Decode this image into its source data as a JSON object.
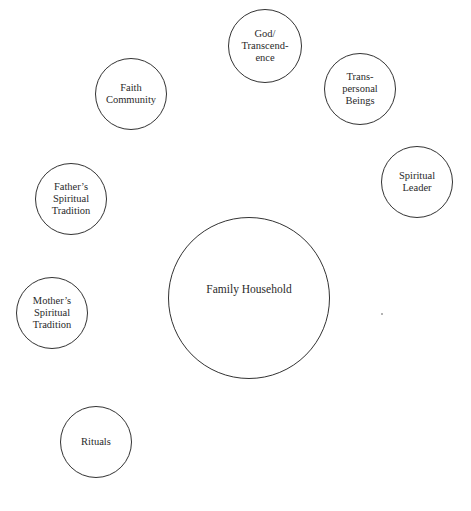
{
  "diagram": {
    "type": "spiritual-ecomap",
    "center": {
      "id": "family-household",
      "label": "Family Household",
      "cx": 249,
      "cy": 298,
      "r": 81
    },
    "nodes": [
      {
        "id": "god-transcendence",
        "label": "God/\nTranscend-\nence",
        "cx": 265,
        "cy": 46,
        "r": 37
      },
      {
        "id": "faith-community",
        "label": "Faith\nCommunity",
        "cx": 131,
        "cy": 94,
        "r": 36
      },
      {
        "id": "transpersonal-beings",
        "label": "Trans-\npersonal\nBeings",
        "cx": 360,
        "cy": 89,
        "r": 36
      },
      {
        "id": "spiritual-leader",
        "label": "Spiritual\nLeader",
        "cx": 417,
        "cy": 182,
        "r": 36
      },
      {
        "id": "fathers-spiritual-tradition",
        "label": "Father’s\nSpiritual\nTradition",
        "cx": 71,
        "cy": 199,
        "r": 36
      },
      {
        "id": "mothers-spiritual-tradition",
        "label": "Mother’s\nSpiritual\nTradition",
        "cx": 52,
        "cy": 313,
        "r": 36
      },
      {
        "id": "rituals",
        "label": "Rituals",
        "cx": 96,
        "cy": 442,
        "r": 36
      }
    ],
    "colors": {
      "stroke": "#333333",
      "text": "#2a2a2a",
      "background": "#ffffff"
    }
  }
}
